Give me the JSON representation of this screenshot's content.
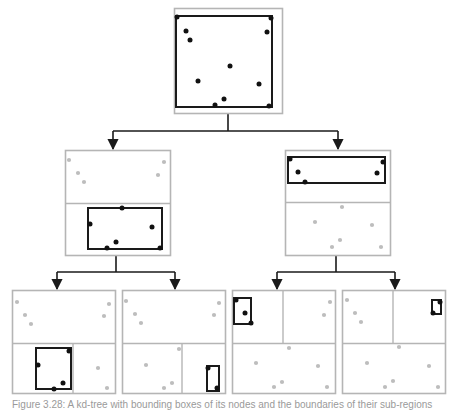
{
  "figure": {
    "caption": "Figure 3.28: A kd-tree with bounding boxes of its nodes and the boundaries of their sub-regions",
    "colors": {
      "active_point": "#111111",
      "inactive_point": "#bdbdbd",
      "bounding_box": "#1a1a1a",
      "region_border": "#b5b5b5",
      "arrow": "#1a1a1a"
    }
  },
  "tree": {
    "root": {
      "label": "root node",
      "region": [
        174,
        8,
        108,
        105
      ],
      "bbox": [
        176,
        16,
        96,
        91
      ],
      "points": [
        [
          177,
          17
        ],
        [
          271,
          18
        ],
        [
          186,
          31
        ],
        [
          190,
          40
        ],
        [
          267,
          32
        ],
        [
          230,
          66
        ],
        [
          198,
          81
        ],
        [
          259,
          84
        ],
        [
          224,
          99
        ],
        [
          215,
          105
        ],
        [
          269,
          106
        ]
      ]
    },
    "level1": [
      {
        "label": "left child",
        "region": [
          65,
          150,
          105,
          105
        ],
        "splits": [
          [
            65,
            203,
            170,
            203
          ]
        ],
        "bbox": [
          88,
          208,
          74,
          41
        ],
        "active_points": [
          [
            122,
            208
          ],
          [
            90,
            224
          ],
          [
            152,
            227
          ],
          [
            116,
            242
          ],
          [
            107,
            248
          ],
          [
            160,
            248
          ]
        ],
        "inactive_points": [
          [
            69,
            160
          ],
          [
            78,
            173
          ],
          [
            84,
            182
          ],
          [
            164,
            162
          ],
          [
            158,
            175
          ]
        ]
      },
      {
        "label": "right child",
        "region": [
          285,
          150,
          105,
          105
        ],
        "splits": [
          [
            285,
            202,
            390,
            202
          ]
        ],
        "bbox": [
          288,
          157,
          97,
          26
        ],
        "active_points": [
          [
            290,
            159
          ],
          [
            383,
            162
          ],
          [
            298,
            172
          ],
          [
            377,
            173
          ],
          [
            305,
            182
          ]
        ],
        "inactive_points": [
          [
            342,
            207
          ],
          [
            315,
            222
          ],
          [
            372,
            225
          ],
          [
            340,
            240
          ],
          [
            332,
            247
          ],
          [
            381,
            247
          ]
        ]
      }
    ],
    "level2": [
      {
        "label": "left-left leaf",
        "region": [
          12,
          290,
          103,
          103
        ],
        "splits": [
          [
            12,
            343,
            115,
            343
          ],
          [
            73,
            343,
            73,
            393
          ]
        ],
        "bbox": [
          36,
          348,
          35,
          41
        ],
        "active_points": [
          [
            69,
            351
          ],
          [
            38,
            365
          ],
          [
            63,
            383
          ],
          [
            54,
            389
          ]
        ],
        "inactive_points": [
          [
            17,
            302
          ],
          [
            25,
            315
          ],
          [
            31,
            324
          ],
          [
            109,
            304
          ],
          [
            104,
            316
          ],
          [
            98,
            368
          ],
          [
            107,
            388
          ]
        ]
      },
      {
        "label": "left-right leaf",
        "region": [
          122,
          290,
          103,
          103
        ],
        "splits": [
          [
            122,
            343,
            225,
            343
          ],
          [
            182,
            343,
            182,
            393
          ]
        ],
        "bbox": [
          207,
          366,
          12,
          25
        ],
        "active_points": [
          [
            208,
            368
          ],
          [
            217,
            388
          ]
        ],
        "inactive_points": [
          [
            126,
            301
          ],
          [
            135,
            314
          ],
          [
            141,
            323
          ],
          [
            219,
            303
          ],
          [
            214,
            315
          ],
          [
            179,
            349
          ],
          [
            146,
            365
          ],
          [
            172,
            383
          ],
          [
            164,
            388
          ]
        ]
      },
      {
        "label": "right-left leaf",
        "region": [
          232,
          290,
          103,
          103
        ],
        "splits": [
          [
            232,
            343,
            335,
            343
          ],
          [
            283,
            290,
            283,
            343
          ]
        ],
        "bbox": [
          234,
          298,
          17,
          26
        ],
        "active_points": [
          [
            236,
            300
          ],
          [
            245,
            313
          ],
          [
            251,
            323
          ]
        ],
        "inactive_points": [
          [
            330,
            302
          ],
          [
            324,
            315
          ],
          [
            289,
            348
          ],
          [
            256,
            363
          ],
          [
            318,
            366
          ],
          [
            282,
            382
          ],
          [
            274,
            387
          ],
          [
            327,
            387
          ]
        ]
      },
      {
        "label": "right-right leaf",
        "region": [
          342,
          290,
          103,
          103
        ],
        "splits": [
          [
            342,
            343,
            445,
            343
          ],
          [
            393,
            290,
            393,
            343
          ]
        ],
        "bbox": [
          432,
          300,
          9,
          14
        ],
        "active_points": [
          [
            440,
            302
          ],
          [
            433,
            313
          ]
        ],
        "inactive_points": [
          [
            347,
            300
          ],
          [
            355,
            313
          ],
          [
            361,
            322
          ],
          [
            399,
            347
          ],
          [
            367,
            363
          ],
          [
            429,
            366
          ],
          [
            393,
            381
          ],
          [
            385,
            387
          ],
          [
            438,
            387
          ]
        ]
      }
    ],
    "connectors": [
      {
        "from": [
          228,
          113
        ],
        "junction_y": 131,
        "targets": [
          [
            113,
            150
          ],
          [
            338,
            150
          ]
        ]
      },
      {
        "from": [
          116,
          255
        ],
        "junction_y": 272,
        "targets": [
          [
            57,
            290
          ],
          [
            175,
            290
          ]
        ]
      },
      {
        "from": [
          336,
          255
        ],
        "junction_y": 272,
        "targets": [
          [
            277,
            290
          ],
          [
            395,
            290
          ]
        ]
      }
    ]
  }
}
